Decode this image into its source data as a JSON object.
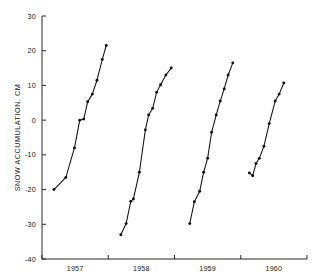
{
  "chart_data": {
    "type": "line",
    "title": "",
    "xlabel": "",
    "ylabel": "SNOW ACCUMULATION, CM",
    "xlim": [
      1956.5,
      1960.5
    ],
    "ylim": [
      -40,
      30
    ],
    "grid": false,
    "legend": "none",
    "yticks": [
      30,
      20,
      10,
      0,
      -10,
      -20,
      -30,
      -40
    ],
    "ytick_labels": [
      "30",
      "20",
      "10",
      "0",
      "-10",
      "-20",
      "-30",
      "-40"
    ],
    "xticks": [
      1956.5,
      1957.5,
      1958.5,
      1959.5,
      1960.5
    ],
    "xtick_labels": [
      "1957",
      "1958",
      "1959",
      "1960"
    ],
    "xtick_label_positions": [
      1957,
      1958,
      1959,
      1960
    ],
    "marker": "filled-circle",
    "series": [
      {
        "name": "1957",
        "x": [
          1956.68,
          1956.86,
          1956.99,
          1957.07,
          1957.13,
          1957.19,
          1957.26,
          1957.33,
          1957.41,
          1957.47
        ],
        "y": [
          -20.0,
          -16.5,
          -8.0,
          0.0,
          0.3,
          5.3,
          7.5,
          11.5,
          17.5,
          21.5
        ]
      },
      {
        "name": "1958",
        "x": [
          1957.69,
          1957.77,
          1957.84,
          1957.88,
          1957.97,
          1958.06,
          1958.11,
          1958.17,
          1958.23,
          1958.29,
          1958.37,
          1958.45
        ],
        "y": [
          -33.0,
          -29.8,
          -23.4,
          -22.7,
          -15.0,
          -2.8,
          1.5,
          3.4,
          8.0,
          10.2,
          13.0,
          15.0
        ]
      },
      {
        "name": "1959",
        "x": [
          1958.73,
          1958.8,
          1958.88,
          1958.94,
          1959.0,
          1959.06,
          1959.13,
          1959.19,
          1959.25,
          1959.31,
          1959.38
        ],
        "y": [
          -29.8,
          -23.5,
          -20.5,
          -15.0,
          -11.0,
          -3.5,
          1.5,
          5.5,
          9.0,
          13.0,
          16.5
        ]
      },
      {
        "name": "1960",
        "x": [
          1959.63,
          1959.68,
          1959.73,
          1959.78,
          1959.85,
          1959.93,
          1960.02,
          1960.08,
          1960.15
        ],
        "y": [
          -15.2,
          -16.0,
          -12.5,
          -11.0,
          -7.5,
          -1.0,
          5.5,
          7.5,
          10.7
        ]
      }
    ]
  },
  "plot_geometry": {
    "left_px": 42,
    "right_px": 307,
    "top_px": 16,
    "bottom_px": 259
  }
}
